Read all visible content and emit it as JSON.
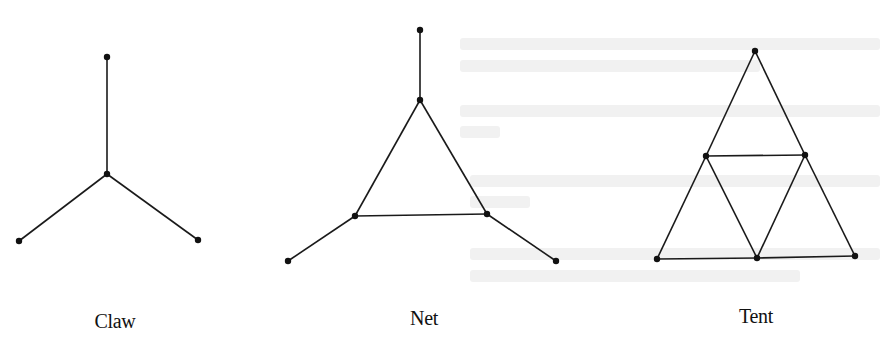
{
  "figure": {
    "colors": {
      "edge": "#1a1a1a",
      "vertex": "#111111",
      "background": "#ffffff"
    },
    "graphs": [
      {
        "name": "Claw",
        "label": "Claw",
        "label_pos": [
          115,
          310
        ],
        "vertices": [
          [
            107,
            57
          ],
          [
            107,
            174
          ],
          [
            19,
            241
          ],
          [
            198,
            240
          ]
        ],
        "edges": [
          [
            0,
            1
          ],
          [
            1,
            2
          ],
          [
            1,
            3
          ]
        ]
      },
      {
        "name": "Net",
        "label": "Net",
        "label_pos": [
          424,
          307
        ],
        "vertices": [
          [
            420,
            30
          ],
          [
            420,
            100
          ],
          [
            355,
            216
          ],
          [
            487,
            214
          ],
          [
            288,
            261
          ],
          [
            556,
            261
          ]
        ],
        "edges": [
          [
            0,
            1
          ],
          [
            1,
            2
          ],
          [
            1,
            3
          ],
          [
            2,
            3
          ],
          [
            2,
            4
          ],
          [
            3,
            5
          ]
        ]
      },
      {
        "name": "Tent",
        "label": "Tent",
        "label_pos": [
          756,
          305
        ],
        "vertices": [
          [
            755,
            51
          ],
          [
            706,
            156
          ],
          [
            805,
            155
          ],
          [
            657,
            259
          ],
          [
            757,
            258
          ],
          [
            855,
            256
          ]
        ],
        "edges": [
          [
            0,
            1
          ],
          [
            0,
            2
          ],
          [
            1,
            2
          ],
          [
            1,
            3
          ],
          [
            1,
            4
          ],
          [
            2,
            4
          ],
          [
            2,
            5
          ],
          [
            3,
            4
          ],
          [
            4,
            5
          ]
        ]
      }
    ]
  },
  "ghost_lines": [
    [
      460,
      38,
      420
    ],
    [
      460,
      60,
      300
    ],
    [
      460,
      105,
      420
    ],
    [
      460,
      126,
      40
    ],
    [
      470,
      175,
      410
    ],
    [
      470,
      196,
      60
    ],
    [
      470,
      248,
      410
    ],
    [
      470,
      270,
      330
    ]
  ]
}
